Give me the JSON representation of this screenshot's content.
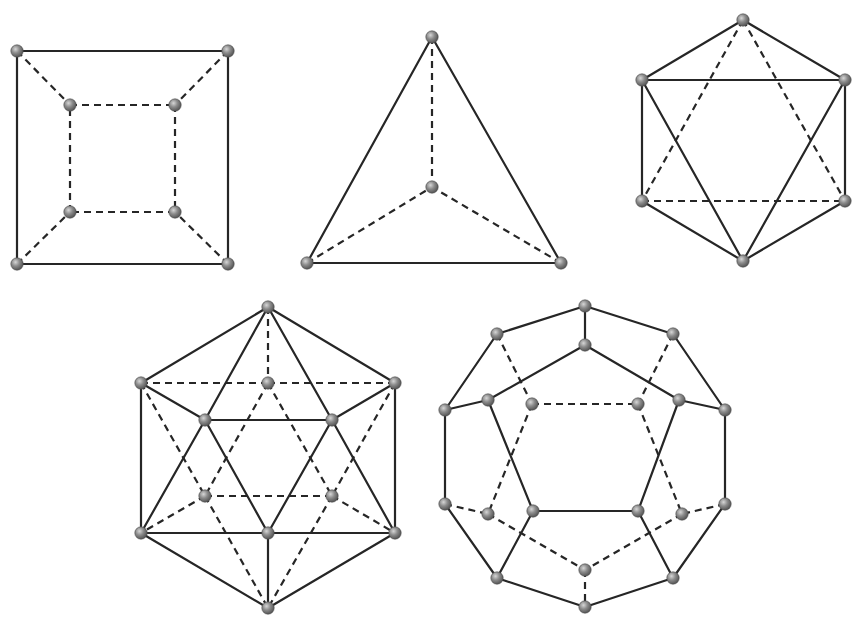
{
  "figure": {
    "colors": {
      "edge": "#262626",
      "vertex_light": "#c8c8c8",
      "vertex_dark": "#555555",
      "background": "#ffffff"
    },
    "solids": [
      {
        "name": "cube",
        "vertices": [
          [
            17,
            51
          ],
          [
            228,
            51
          ],
          [
            17,
            264
          ],
          [
            228,
            264
          ],
          [
            70,
            105
          ],
          [
            175,
            105
          ],
          [
            70,
            212
          ],
          [
            175,
            212
          ]
        ],
        "solid_edges": [
          [
            0,
            1
          ],
          [
            1,
            3
          ],
          [
            3,
            2
          ],
          [
            2,
            0
          ]
        ],
        "dashed_edges": [
          [
            0,
            4
          ],
          [
            1,
            5
          ],
          [
            2,
            6
          ],
          [
            3,
            7
          ],
          [
            4,
            5
          ],
          [
            5,
            7
          ],
          [
            7,
            6
          ],
          [
            6,
            4
          ]
        ]
      },
      {
        "name": "tetrahedron",
        "vertices": [
          [
            432,
            37
          ],
          [
            307,
            263
          ],
          [
            561,
            263
          ],
          [
            432,
            187
          ]
        ],
        "solid_edges": [
          [
            0,
            1
          ],
          [
            0,
            2
          ],
          [
            1,
            2
          ]
        ],
        "dashed_edges": [
          [
            0,
            3
          ],
          [
            1,
            3
          ],
          [
            2,
            3
          ]
        ]
      },
      {
        "name": "octahedron",
        "vertices": [
          [
            743,
            20
          ],
          [
            642,
            80
          ],
          [
            845,
            80
          ],
          [
            642,
            201
          ],
          [
            845,
            201
          ],
          [
            743,
            261
          ]
        ],
        "solid_edges": [
          [
            0,
            1
          ],
          [
            0,
            2
          ],
          [
            1,
            2
          ],
          [
            1,
            3
          ],
          [
            2,
            4
          ],
          [
            1,
            5
          ],
          [
            2,
            5
          ],
          [
            3,
            5
          ],
          [
            4,
            5
          ]
        ],
        "dashed_edges": [
          [
            0,
            3
          ],
          [
            0,
            4
          ],
          [
            3,
            4
          ]
        ]
      },
      {
        "name": "icosahedron",
        "vertices": [
          [
            268,
            307
          ],
          [
            141,
            383
          ],
          [
            395,
            383
          ],
          [
            268,
            383
          ],
          [
            205,
            420
          ],
          [
            332,
            420
          ],
          [
            205,
            496
          ],
          [
            332,
            496
          ],
          [
            141,
            533
          ],
          [
            395,
            533
          ],
          [
            268,
            533
          ],
          [
            268,
            608
          ]
        ],
        "solid_edges": [
          [
            0,
            1
          ],
          [
            0,
            2
          ],
          [
            0,
            4
          ],
          [
            0,
            5
          ],
          [
            1,
            4
          ],
          [
            2,
            5
          ],
          [
            4,
            5
          ],
          [
            1,
            8
          ],
          [
            2,
            9
          ],
          [
            4,
            8
          ],
          [
            4,
            10
          ],
          [
            5,
            10
          ],
          [
            5,
            9
          ],
          [
            8,
            10
          ],
          [
            10,
            9
          ],
          [
            8,
            11
          ],
          [
            9,
            11
          ],
          [
            10,
            11
          ]
        ],
        "dashed_edges": [
          [
            0,
            3
          ],
          [
            1,
            3
          ],
          [
            3,
            2
          ],
          [
            3,
            6
          ],
          [
            3,
            7
          ],
          [
            1,
            6
          ],
          [
            2,
            7
          ],
          [
            6,
            7
          ],
          [
            6,
            8
          ],
          [
            7,
            9
          ],
          [
            6,
            11
          ],
          [
            7,
            11
          ]
        ]
      },
      {
        "name": "dodecahedron",
        "vertices": [
          [
            585,
            306
          ],
          [
            585,
            345
          ],
          [
            497,
            334
          ],
          [
            673,
            334
          ],
          [
            445,
            410
          ],
          [
            725,
            410
          ],
          [
            488,
            400
          ],
          [
            679,
            400
          ],
          [
            532,
            404
          ],
          [
            638,
            404
          ],
          [
            445,
            504
          ],
          [
            725,
            504
          ],
          [
            488,
            514
          ],
          [
            682,
            514
          ],
          [
            533,
            511
          ],
          [
            638,
            511
          ],
          [
            585,
            570
          ],
          [
            497,
            578
          ],
          [
            673,
            578
          ],
          [
            585,
            607
          ]
        ],
        "solid_edges": [
          [
            0,
            1
          ],
          [
            0,
            2
          ],
          [
            0,
            3
          ],
          [
            2,
            4
          ],
          [
            3,
            5
          ],
          [
            1,
            6
          ],
          [
            1,
            7
          ],
          [
            4,
            6
          ],
          [
            5,
            7
          ],
          [
            4,
            10
          ],
          [
            5,
            11
          ],
          [
            6,
            14
          ],
          [
            7,
            15
          ],
          [
            14,
            15
          ],
          [
            14,
            17
          ],
          [
            15,
            18
          ],
          [
            10,
            17
          ],
          [
            11,
            18
          ],
          [
            17,
            19
          ],
          [
            18,
            19
          ]
        ],
        "dashed_edges": [
          [
            2,
            8
          ],
          [
            3,
            9
          ],
          [
            8,
            9
          ],
          [
            8,
            12
          ],
          [
            9,
            13
          ],
          [
            10,
            12
          ],
          [
            11,
            13
          ],
          [
            12,
            16
          ],
          [
            13,
            16
          ],
          [
            16,
            19
          ]
        ]
      }
    ]
  }
}
